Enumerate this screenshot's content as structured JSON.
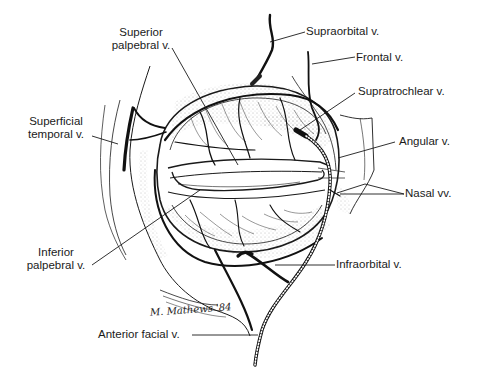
{
  "diagram": {
    "style": "black-and-white anatomical pen illustration",
    "colors": {
      "background": "#ffffff",
      "ink": "#1a1a1a"
    },
    "signature": "M. Mathews '84",
    "labels": [
      {
        "id": "superior-palpebral",
        "line1": "Superior",
        "line2": "palpebral v."
      },
      {
        "id": "supraorbital",
        "text": "Supraorbital v."
      },
      {
        "id": "frontal",
        "text": "Frontal v."
      },
      {
        "id": "supratrochlear",
        "text": "Supratrochlear v."
      },
      {
        "id": "angular",
        "text": "Angular v."
      },
      {
        "id": "nasal",
        "text": "Nasal vv."
      },
      {
        "id": "superficial-temporal",
        "line1": "Superficial",
        "line2": "temporal v."
      },
      {
        "id": "inferior-palpebral",
        "line1": "Inferior",
        "line2": "palpebral v."
      },
      {
        "id": "infraorbital",
        "text": "Infraorbital v."
      },
      {
        "id": "anterior-facial",
        "text": "Anterior facial v."
      }
    ]
  }
}
